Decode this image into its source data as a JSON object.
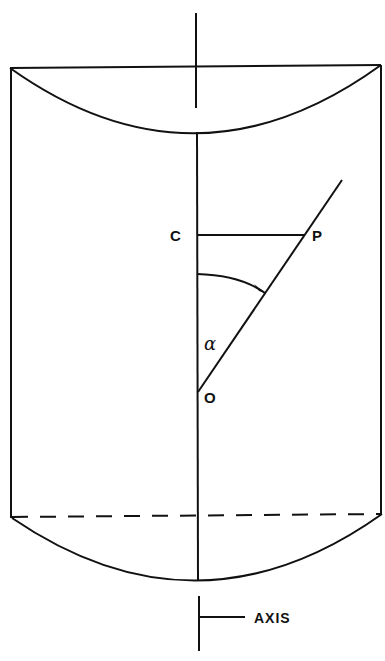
{
  "diagram": {
    "type": "geometric-figure",
    "labels": {
      "c": "C",
      "p": "P",
      "o": "O",
      "alpha": "α",
      "axis": "AXIS"
    },
    "colors": {
      "stroke": "#111111",
      "background": "#ffffff"
    }
  }
}
